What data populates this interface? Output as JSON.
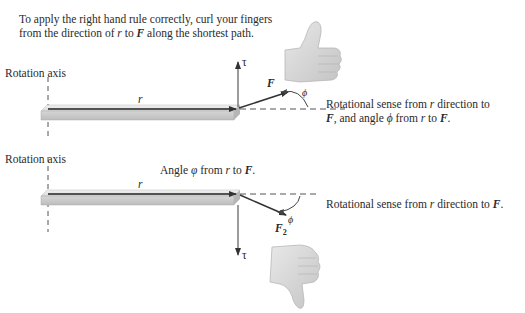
{
  "intro": {
    "line1": "To apply the right hand rule correctly, curl your fingers",
    "line2_prefix": "from the direction of ",
    "line2_r": "r",
    "line2_mid": " to ",
    "line2_F": "F",
    "line2_suffix": " along the shortest path."
  },
  "top_diagram": {
    "axis_label": "Rotation axis",
    "r_label": "r",
    "tau_label": "τ",
    "F_label": "F",
    "phi_label": "ϕ",
    "caption_line1_a": "Rotational sense from ",
    "caption_line1_r": "r",
    "caption_line1_b": " direction to",
    "caption_line2_F": "F",
    "caption_line2_a": ", and angle ",
    "caption_line2_phi": "ϕ",
    "caption_line2_b": " from ",
    "caption_line2_r": "r",
    "caption_line2_c": " to ",
    "caption_line2_F2": "F",
    "caption_line2_d": ".",
    "hand": "thumbs-up"
  },
  "bottom_diagram": {
    "axis_label": "Rotation axis",
    "angle_caption_a": "Angle ",
    "angle_caption_phi": "φ",
    "angle_caption_b": " from ",
    "angle_caption_r": "r",
    "angle_caption_c": " to ",
    "angle_caption_F": "F",
    "angle_caption_d": ".",
    "r_label": "r",
    "tau_label": "τ",
    "F2_label": "F",
    "F2_sub": "2",
    "phi_label": "ϕ",
    "caption_a": "Rotational sense from ",
    "caption_r": "r",
    "caption_b": " direction to ",
    "caption_F": "F",
    "caption_end": ".",
    "hand": "thumbs-down"
  },
  "colors": {
    "bar_top": "#e6e6e6",
    "bar_front": "#c8c8c8",
    "vector": "#333333",
    "hand": "#d4d4d4",
    "text": "#2a2a2a"
  }
}
